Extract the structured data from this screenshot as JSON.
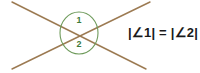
{
  "figure": {
    "background_color": "#ffffff",
    "line_color": "#9c7a52",
    "arc_color": "#6f9b5c",
    "label_color": "#3d7a3a",
    "text_color": "#1a1a1a"
  },
  "lines": [
    {
      "name": "line-upper-left-to-lower-right",
      "x1": 12,
      "y1": 2,
      "x2": 146,
      "y2": 69
    },
    {
      "name": "line-lower-left-to-upper-right",
      "x1": 12,
      "y1": 69,
      "x2": 150,
      "y2": 2
    }
  ],
  "intersection": {
    "x": 79,
    "y": 33
  },
  "angles": [
    {
      "name": "angle-1",
      "label": "1",
      "label_x": 79,
      "label_y": 21,
      "position": "top"
    },
    {
      "name": "angle-2",
      "label": "2",
      "label_x": 79,
      "label_y": 45,
      "position": "bottom"
    }
  ],
  "equation": {
    "text": "|∠1| = |∠2|",
    "x": 128,
    "y": 24
  }
}
